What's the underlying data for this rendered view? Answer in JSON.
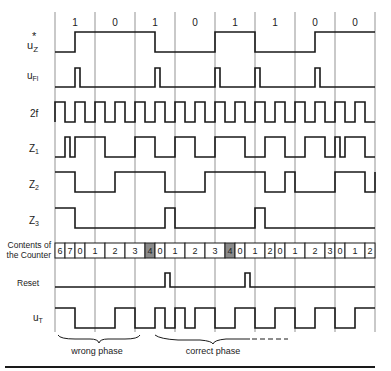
{
  "figure": {
    "bit_labels": [
      "1",
      "0",
      "1",
      "0",
      "1",
      "1",
      "0",
      "0"
    ],
    "signal_labels": {
      "uz": {
        "base": "u",
        "sub": "Z",
        "sup": "*"
      },
      "ufl": {
        "base": "u",
        "sub": "Fl"
      },
      "clk": {
        "base": "2f"
      },
      "z1": {
        "base": "Z",
        "sub": "1"
      },
      "z2": {
        "base": "Z",
        "sub": "2"
      },
      "z3": {
        "base": "Z",
        "sub": "3"
      },
      "counter": {
        "line1": "Contents of",
        "line2": "the Counter"
      },
      "reset": {
        "base": "Reset"
      },
      "ut": {
        "base": "u",
        "sub": "T"
      }
    },
    "time_units_per_bit": 8,
    "total_bits": 8,
    "signals": {
      "uz": [
        [
          0,
          0
        ],
        [
          4,
          1
        ],
        [
          20,
          0
        ],
        [
          32,
          1
        ],
        [
          40,
          0
        ],
        [
          52,
          1
        ],
        [
          64,
          1
        ]
      ],
      "ufl": [
        [
          0,
          0
        ],
        [
          4,
          1
        ],
        [
          5,
          0
        ],
        [
          20,
          1
        ],
        [
          21,
          0
        ],
        [
          32,
          1
        ],
        [
          33,
          0
        ],
        [
          40,
          1
        ],
        [
          41,
          0
        ],
        [
          52,
          1
        ],
        [
          53,
          0
        ],
        [
          64,
          0
        ]
      ],
      "clk": "square_2f",
      "z1": [
        [
          0,
          0
        ],
        [
          2,
          1
        ],
        [
          3,
          0
        ],
        [
          4,
          1
        ],
        [
          8,
          1
        ],
        [
          10,
          0
        ],
        [
          16,
          1
        ],
        [
          20,
          0
        ],
        [
          24,
          1
        ],
        [
          28,
          0
        ],
        [
          32,
          1
        ],
        [
          38,
          0
        ],
        [
          42,
          1
        ],
        [
          46,
          0
        ],
        [
          50,
          1
        ],
        [
          54,
          0
        ],
        [
          56,
          1
        ],
        [
          57,
          0
        ],
        [
          58,
          1
        ],
        [
          62,
          0
        ],
        [
          64,
          0
        ]
      ],
      "z2": [
        [
          0,
          1
        ],
        [
          4,
          0
        ],
        [
          12,
          1
        ],
        [
          22,
          0
        ],
        [
          30,
          1
        ],
        [
          42,
          0
        ],
        [
          46,
          1
        ],
        [
          48,
          0
        ],
        [
          56,
          1
        ],
        [
          62,
          0
        ],
        [
          64,
          1
        ]
      ],
      "z3": [
        [
          0,
          1
        ],
        [
          4,
          0
        ],
        [
          22,
          1
        ],
        [
          24,
          0
        ],
        [
          40,
          1
        ],
        [
          42,
          0
        ],
        [
          64,
          0
        ]
      ],
      "reset": [
        [
          0,
          0
        ],
        [
          22,
          1
        ],
        [
          23,
          0
        ],
        [
          38,
          1
        ],
        [
          39,
          0
        ],
        [
          64,
          0
        ]
      ],
      "ut": [
        [
          0,
          1
        ],
        [
          4,
          0
        ],
        [
          12,
          1
        ],
        [
          16,
          0
        ],
        [
          20,
          1
        ],
        [
          22,
          0
        ],
        [
          24,
          1
        ],
        [
          26,
          0
        ],
        [
          28,
          1
        ],
        [
          32,
          0
        ],
        [
          36,
          1
        ],
        [
          40,
          0
        ],
        [
          44,
          1
        ],
        [
          48,
          0
        ],
        [
          52,
          1
        ],
        [
          56,
          0
        ],
        [
          60,
          1
        ],
        [
          64,
          1
        ]
      ]
    },
    "counter_cells": [
      {
        "v": "6",
        "span": 1
      },
      {
        "v": "7",
        "span": 1
      },
      {
        "v": "0",
        "span": 1
      },
      {
        "v": "1",
        "span": 2
      },
      {
        "v": "2",
        "span": 2
      },
      {
        "v": "3",
        "span": 2
      },
      {
        "v": "4",
        "span": 1,
        "shaded": true
      },
      {
        "v": "0",
        "span": 1
      },
      {
        "v": "1",
        "span": 2
      },
      {
        "v": "2",
        "span": 2
      },
      {
        "v": "3",
        "span": 2
      },
      {
        "v": "4",
        "span": 1,
        "shaded": true
      },
      {
        "v": "0",
        "span": 1
      },
      {
        "v": "1",
        "span": 2
      },
      {
        "v": "2",
        "span": 1
      },
      {
        "v": "0",
        "span": 1
      },
      {
        "v": "1",
        "span": 2
      },
      {
        "v": "2",
        "span": 2
      },
      {
        "v": "3",
        "span": 1
      },
      {
        "v": "0",
        "span": 1
      },
      {
        "v": "1",
        "span": 2
      },
      {
        "v": "2",
        "span": 1
      }
    ],
    "annotations": {
      "wrong_phase": "wrong phase",
      "correct_phase": "correct phase"
    },
    "colors": {
      "line": "#1a1a1a",
      "grid": "#666666",
      "shaded_cell": "#8a8a8a"
    }
  }
}
